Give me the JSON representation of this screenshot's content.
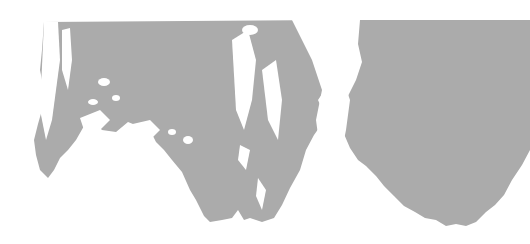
{
  "image": {
    "description": "Abstract gray ink-blot texture on white background",
    "background_color": "#ffffff",
    "fill_color": "#ababab",
    "shapes": [
      "left-blot",
      "right-blot"
    ]
  }
}
